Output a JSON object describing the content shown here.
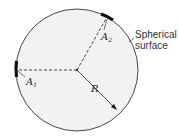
{
  "diagram": {
    "shape": "sphere-cross-section",
    "colors": {
      "fill": "#f2f2f2",
      "stroke": "#333333",
      "patch": "#111111"
    },
    "labels": {
      "surface_line1": "Spherical",
      "surface_line2": "surface",
      "radius": "R",
      "area1_main": "A",
      "area1_sub": "1",
      "area2_main": "A",
      "area2_sub": "2"
    }
  }
}
